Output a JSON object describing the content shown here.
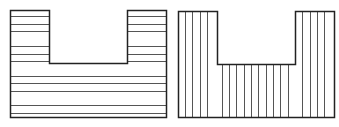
{
  "diagram": {
    "width": 339,
    "height": 127,
    "background": "#ffffff",
    "stroke_color": "#222222",
    "hatch_color": "#555555",
    "shapes": [
      {
        "id": "u-shape-horizontal-hatch",
        "description": "U-shaped region with horizontal hatching",
        "outline": [
          [
            10,
            10
          ],
          [
            49,
            10
          ],
          [
            49,
            63
          ],
          [
            127,
            63
          ],
          [
            127,
            10
          ],
          [
            166,
            10
          ],
          [
            166,
            117
          ],
          [
            10,
            117
          ]
        ],
        "hatch": "horizontal",
        "hatch_lines_y": [
          16,
          24,
          31,
          46,
          54,
          61,
          76,
          83,
          91,
          105,
          113
        ],
        "x_min": 10,
        "x_max": 166,
        "notch": {
          "x_left": 49,
          "x_right": 127,
          "y_bottom": 63
        }
      },
      {
        "id": "u-shape-vertical-hatch",
        "description": "U-shaped region with vertical hatching",
        "outline": [
          [
            178,
            11
          ],
          [
            217,
            11
          ],
          [
            217,
            64
          ],
          [
            295,
            64
          ],
          [
            295,
            11
          ],
          [
            334,
            11
          ],
          [
            334,
            117
          ],
          [
            178,
            117
          ]
        ],
        "hatch": "vertical",
        "hatch_lines_x": [
          185,
          192,
          200,
          207,
          222,
          229,
          236,
          244,
          251,
          258,
          266,
          273,
          280,
          288,
          302,
          310,
          317,
          324
        ],
        "y_min": 11,
        "y_max": 117,
        "notch": {
          "x_left": 217,
          "x_right": 295,
          "y_bottom": 64
        }
      }
    ]
  }
}
